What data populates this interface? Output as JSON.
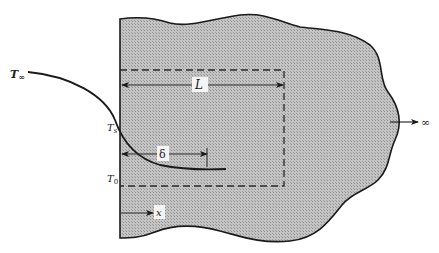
{
  "figure": {
    "colors": {
      "body_fill": "#b9b9b9",
      "stroke": "#1a1a1a",
      "background": "#ffffff"
    }
  },
  "labels": {
    "t_infinity": {
      "base": "T",
      "sub": "∞"
    },
    "t_surface": {
      "base": "T",
      "sub": "s"
    },
    "t_zero": {
      "base": "T",
      "sub": "0"
    },
    "length": "L",
    "delta": "δ",
    "x_axis": "x",
    "infinity": "∞"
  }
}
